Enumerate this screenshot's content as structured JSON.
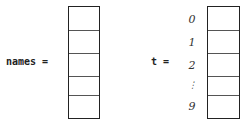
{
  "left": {
    "label": "names ="
  },
  "right": {
    "label": "t =",
    "indices": [
      "0",
      "1",
      "2",
      "⋮",
      "9"
    ]
  }
}
